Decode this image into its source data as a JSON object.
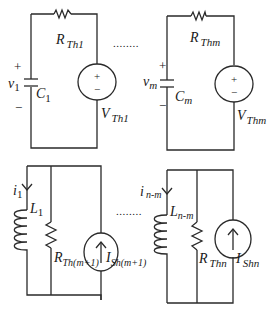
{
  "figure": {
    "type": "circuit-diagram",
    "top_row": {
      "left_circuit": {
        "resistor": {
          "symbol": "R",
          "subscript": "Th1"
        },
        "capacitor": {
          "symbol": "C",
          "subscript": "1"
        },
        "voltage": {
          "symbol": "v",
          "subscript": "1",
          "plus": "+",
          "minus": "−"
        },
        "source": {
          "symbol": "V",
          "subscript": "Th1",
          "plus": "+",
          "minus": "−"
        }
      },
      "ellipsis": "........",
      "right_circuit": {
        "resistor": {
          "symbol": "R",
          "subscript": "Thm"
        },
        "capacitor": {
          "symbol": "C",
          "subscript": "m"
        },
        "voltage": {
          "symbol": "v",
          "subscript": "m",
          "plus": "+",
          "minus": "−"
        },
        "source": {
          "symbol": "V",
          "subscript": "Thm",
          "plus": "+",
          "minus": "−"
        }
      }
    },
    "bottom_row": {
      "left_circuit": {
        "current": {
          "symbol": "i",
          "subscript": "1"
        },
        "inductor": {
          "symbol": "L",
          "subscript": "1"
        },
        "resistor": {
          "symbol": "R",
          "subscript": "Th(m+1)"
        },
        "source": {
          "symbol": "I",
          "subscript": "Sh(m+1)",
          "arrow": "↑"
        }
      },
      "ellipsis": "........",
      "right_circuit": {
        "current": {
          "symbol": "i",
          "subscript": "n-m"
        },
        "inductor": {
          "symbol": "L",
          "subscript": "n-m"
        },
        "resistor": {
          "symbol": "R",
          "subscript": "Thn"
        },
        "source": {
          "symbol": "I",
          "subscript": "Shn",
          "arrow": "↑"
        }
      }
    }
  }
}
